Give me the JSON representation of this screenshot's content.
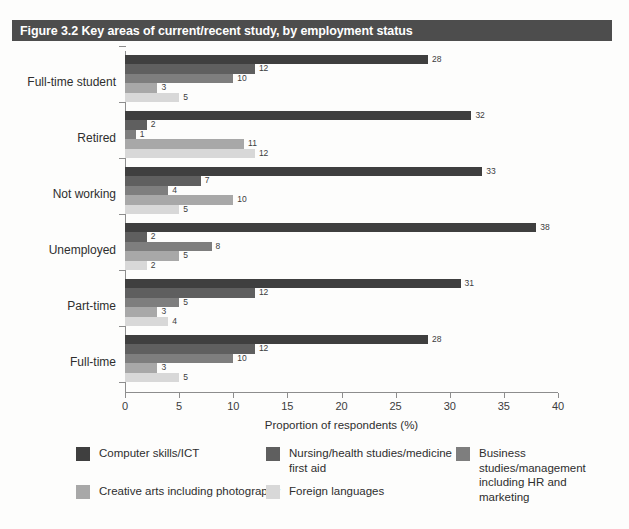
{
  "figure": {
    "title": "Figure 3.2 Key areas of current/recent study, by employment status",
    "title_bar_color": "#4d4d4d"
  },
  "chart_data": {
    "type": "bar",
    "orientation": "horizontal",
    "title": "Figure 3.2 Key areas of current/recent study, by employment status",
    "xlabel": "Proportion of respondents (%)",
    "ylabel": "",
    "xlim": [
      0,
      40
    ],
    "xticks": [
      0,
      5,
      10,
      15,
      20,
      25,
      30,
      35,
      40
    ],
    "grid": false,
    "legend_position": "bottom",
    "categories": [
      "Full-time student",
      "Retired",
      "Not working",
      "Unemployed",
      "Part-time",
      "Full-time"
    ],
    "series": [
      {
        "name": "Computer skills/ICT",
        "color": "#3f3f3f",
        "values": [
          28,
          32,
          33,
          38,
          31,
          28
        ]
      },
      {
        "name": "Nursing/health studies/medicine\nfirst aid",
        "color": "#5f5f5f",
        "values": [
          12,
          2,
          7,
          2,
          12,
          12
        ]
      },
      {
        "name": "Business studies/management\nincluding HR and marketing",
        "color": "#7e7e7e",
        "values": [
          10,
          1,
          4,
          8,
          5,
          10
        ]
      },
      {
        "name": "Creative arts including photography",
        "color": "#a8a8a8",
        "values": [
          3,
          11,
          10,
          5,
          3,
          3
        ]
      },
      {
        "name": "Foreign languages",
        "color": "#d8d8d8",
        "values": [
          5,
          12,
          5,
          2,
          4,
          5
        ]
      }
    ]
  }
}
